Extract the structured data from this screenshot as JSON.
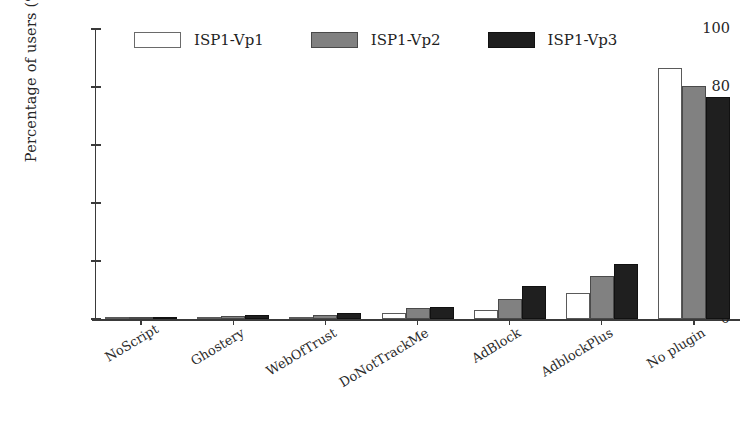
{
  "chart_data": {
    "type": "bar",
    "title": "",
    "xlabel": "",
    "ylabel": "Percentage of users (%)",
    "ylim": [
      0,
      100
    ],
    "yticks": [
      0,
      20,
      40,
      60,
      80,
      100
    ],
    "ytick_labels": [
      "0",
      "20",
      "40",
      "60",
      "80",
      "100"
    ],
    "grid": false,
    "legend_position": "top-center",
    "categories": [
      "NoScript",
      "Ghostery",
      "WebOfTrust",
      "DoNotTrackMe",
      "AdBlock",
      "AdblockPlus",
      "No plugin"
    ],
    "series": [
      {
        "name": "ISP1-Vp1",
        "color": "#ffffff",
        "edge_color": "#5a5a5a",
        "values": [
          0.3,
          0.4,
          0.8,
          2.0,
          3.0,
          9.0,
          86.5
        ]
      },
      {
        "name": "ISP1-Vp2",
        "color": "#818181",
        "edge_color": "#4a4a4a",
        "values": [
          0.5,
          0.9,
          1.5,
          3.8,
          7.0,
          15.0,
          80.5
        ]
      },
      {
        "name": "ISP1-Vp3",
        "color": "#1f1f1f",
        "edge_color": "#111111",
        "values": [
          0.7,
          1.5,
          2.2,
          4.3,
          11.5,
          19.0,
          76.5
        ]
      }
    ]
  },
  "axes": {
    "y_label": "Percentage of users (%)"
  },
  "legend": {
    "entries": [
      {
        "label": "ISP1-Vp1",
        "style": "s0"
      },
      {
        "label": "ISP1-Vp2",
        "style": "s1"
      },
      {
        "label": "ISP1-Vp3",
        "style": "s2"
      }
    ]
  }
}
